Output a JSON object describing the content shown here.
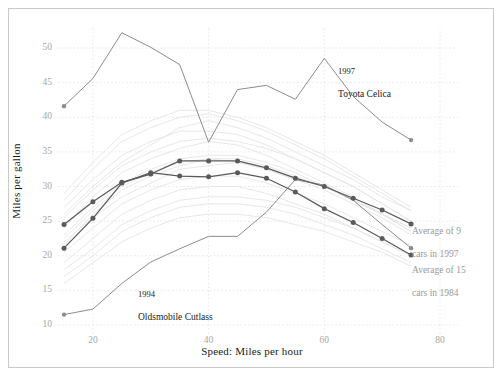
{
  "chart_data": {
    "type": "line",
    "title": "",
    "xlabel": "Speed: Miles per hour",
    "ylabel": "Miles per gallon",
    "xlim": [
      12,
      78
    ],
    "ylim": [
      9,
      53
    ],
    "xticks": [
      20,
      40,
      60,
      80
    ],
    "yticks": [
      10,
      15,
      20,
      25,
      30,
      35,
      40,
      45,
      50
    ],
    "grid": true,
    "legend_position": "inline-annotations",
    "colors": {
      "highlight_line": "#8c8c8c",
      "average_line": "#5a5a5a",
      "background_line": "#e4e4e4",
      "grid": "#e8e0e0",
      "tick_text": "#a6a6a6",
      "axis_text": "#1a1a1a",
      "annotation_gray": "#9a9a9a",
      "frame": "#c9c9c9"
    },
    "series": [
      {
        "name": "1997 Toyota Celica",
        "style": "highlight",
        "color": "#8c8c8c",
        "markers": "endpoints",
        "x": [
          15,
          20,
          25,
          30,
          35,
          40,
          45,
          50,
          55,
          60,
          65,
          70,
          75
        ],
        "values": [
          41.6,
          45.6,
          52.2,
          50.1,
          47.6,
          36.4,
          44.0,
          44.6,
          42.6,
          48.5,
          43.0,
          39.3,
          36.7
        ]
      },
      {
        "name": "1994 Oldsmobile Cutlass",
        "style": "highlight",
        "color": "#8c8c8c",
        "markers": "endpoints",
        "x": [
          15,
          20,
          25,
          30,
          35,
          40,
          45,
          50,
          55,
          60,
          65,
          70,
          75
        ],
        "values": [
          11.5,
          12.3,
          16.0,
          19.1,
          21.0,
          22.8,
          22.8,
          26.3,
          31.0,
          30.2,
          28.0,
          24.5,
          21.1
        ]
      },
      {
        "name": "Average of 9 cars in 1997",
        "style": "average",
        "color": "#5a5a5a",
        "markers": "all",
        "x": [
          15,
          20,
          25,
          30,
          35,
          40,
          45,
          50,
          55,
          60,
          65,
          70,
          75
        ],
        "values": [
          24.5,
          27.8,
          30.6,
          31.8,
          33.7,
          33.7,
          33.7,
          32.7,
          31.2,
          30.0,
          28.3,
          26.6,
          24.6
        ]
      },
      {
        "name": "Average of 15 cars in 1984",
        "style": "average",
        "color": "#5a5a5a",
        "markers": "all",
        "x": [
          15,
          20,
          25,
          30,
          35,
          40,
          45,
          50,
          55,
          60,
          65,
          70,
          75
        ],
        "values": [
          21.1,
          25.4,
          30.5,
          32.0,
          31.5,
          31.4,
          32.0,
          31.2,
          29.2,
          26.8,
          24.8,
          22.5,
          20.1
        ]
      }
    ],
    "background_series": [
      {
        "x": [
          15,
          20,
          25,
          30,
          35,
          40,
          45,
          50,
          55,
          60,
          65,
          70,
          75
        ],
        "values": [
          22.0,
          25.5,
          28.5,
          30.5,
          32.5,
          33.0,
          33.5,
          32.5,
          31.0,
          30.0,
          28.0,
          26.0,
          24.0
        ]
      },
      {
        "x": [
          15,
          20,
          25,
          30,
          35,
          40,
          45,
          50,
          55,
          60,
          65,
          70,
          75
        ],
        "values": [
          26.0,
          30.0,
          33.5,
          36.0,
          38.5,
          39.5,
          38.5,
          37.0,
          35.0,
          33.0,
          31.0,
          28.5,
          26.5
        ]
      },
      {
        "x": [
          15,
          20,
          25,
          30,
          35,
          40,
          45,
          50,
          55,
          60,
          65,
          70,
          75
        ],
        "values": [
          19.0,
          22.5,
          26.0,
          28.0,
          29.5,
          30.0,
          30.0,
          29.0,
          27.5,
          26.0,
          24.0,
          22.0,
          20.0
        ]
      },
      {
        "x": [
          15,
          20,
          25,
          30,
          35,
          40,
          45,
          50,
          55,
          60,
          65,
          70,
          75
        ],
        "values": [
          24.0,
          28.5,
          32.0,
          34.0,
          35.5,
          36.5,
          36.0,
          34.5,
          32.5,
          30.5,
          28.5,
          26.0,
          23.5
        ]
      },
      {
        "x": [
          15,
          20,
          25,
          30,
          35,
          40,
          45,
          50,
          55,
          60,
          65,
          70,
          75
        ],
        "values": [
          17.0,
          20.0,
          23.5,
          25.5,
          27.0,
          27.5,
          27.5,
          27.0,
          26.0,
          24.5,
          23.0,
          21.0,
          19.0
        ]
      },
      {
        "x": [
          15,
          20,
          25,
          30,
          35,
          40,
          45,
          50,
          55,
          60,
          65,
          70,
          75
        ],
        "values": [
          28.0,
          32.5,
          36.5,
          38.5,
          40.0,
          40.5,
          39.5,
          38.0,
          36.0,
          34.0,
          31.5,
          29.0,
          26.5
        ]
      },
      {
        "x": [
          15,
          20,
          25,
          30,
          35,
          40,
          45,
          50,
          55,
          60,
          65,
          70,
          75
        ],
        "values": [
          20.5,
          24.0,
          27.5,
          29.5,
          31.0,
          31.5,
          31.5,
          30.5,
          29.0,
          27.5,
          25.5,
          23.5,
          21.5
        ]
      },
      {
        "x": [
          15,
          20,
          25,
          30,
          35,
          40,
          45,
          50,
          55,
          60,
          65,
          70,
          75
        ],
        "values": [
          23.0,
          27.0,
          30.5,
          32.5,
          34.0,
          34.5,
          34.5,
          33.5,
          32.0,
          30.0,
          28.0,
          26.0,
          24.0
        ]
      },
      {
        "x": [
          15,
          20,
          25,
          30,
          35,
          40,
          45,
          50,
          55,
          60,
          65,
          70,
          75
        ],
        "values": [
          25.5,
          29.5,
          33.0,
          35.0,
          36.5,
          37.0,
          36.5,
          35.5,
          34.0,
          32.0,
          30.0,
          27.5,
          25.0
        ]
      },
      {
        "x": [
          15,
          20,
          25,
          30,
          35,
          40,
          45,
          50,
          55,
          60,
          65,
          70,
          75
        ],
        "values": [
          18.0,
          21.0,
          24.5,
          26.5,
          28.0,
          28.5,
          28.5,
          28.0,
          27.0,
          25.5,
          24.0,
          22.0,
          20.0
        ]
      },
      {
        "x": [
          15,
          20,
          25,
          30,
          35,
          40,
          45,
          50,
          55,
          60,
          65,
          70,
          75
        ],
        "values": [
          21.5,
          26.0,
          29.5,
          31.5,
          33.0,
          34.0,
          33.5,
          32.5,
          31.0,
          29.5,
          27.5,
          25.5,
          23.0
        ]
      },
      {
        "x": [
          15,
          20,
          25,
          30,
          35,
          40,
          45,
          50,
          55,
          60,
          65,
          70,
          75
        ],
        "values": [
          27.0,
          31.0,
          34.5,
          36.5,
          38.0,
          38.0,
          37.5,
          36.0,
          34.0,
          32.0,
          30.0,
          27.5,
          25.0
        ]
      },
      {
        "x": [
          15,
          20,
          25,
          30,
          35,
          40,
          45,
          50,
          55,
          60,
          65,
          70,
          75
        ],
        "values": [
          16.0,
          19.0,
          22.0,
          24.0,
          25.5,
          26.0,
          26.0,
          25.5,
          24.5,
          23.5,
          22.0,
          20.5,
          18.5
        ]
      },
      {
        "x": [
          15,
          20,
          25,
          30,
          35,
          40,
          45,
          50,
          55,
          60,
          65,
          70,
          75
        ],
        "values": [
          29.0,
          33.5,
          37.5,
          39.5,
          41.0,
          41.0,
          40.0,
          38.5,
          36.5,
          34.5,
          32.0,
          29.5,
          27.0
        ]
      },
      {
        "x": [
          15,
          20,
          25,
          30,
          35,
          40,
          45,
          50,
          55,
          60,
          65,
          70,
          75
        ],
        "values": [
          22.5,
          26.5,
          30.0,
          32.0,
          33.5,
          34.0,
          34.0,
          33.0,
          31.5,
          30.0,
          28.0,
          26.0,
          23.5
        ]
      }
    ],
    "annotations": [
      {
        "name": "toyota-celica-label",
        "year": "1997",
        "text": "Toyota Celica",
        "color": "#1a1a1a"
      },
      {
        "name": "oldsmobile-cutlass-label",
        "year": "1994",
        "text": "Oldsmobile Cutlass",
        "color": "#1a1a1a"
      },
      {
        "name": "average-9-1997-label",
        "line1": "Average of 9",
        "line2": "cars in 1997",
        "color": "#9a9a9a"
      },
      {
        "name": "average-15-1984-label",
        "line1": "Average of 15",
        "line2": "cars in 1984",
        "color": "#9a9a9a"
      }
    ]
  }
}
